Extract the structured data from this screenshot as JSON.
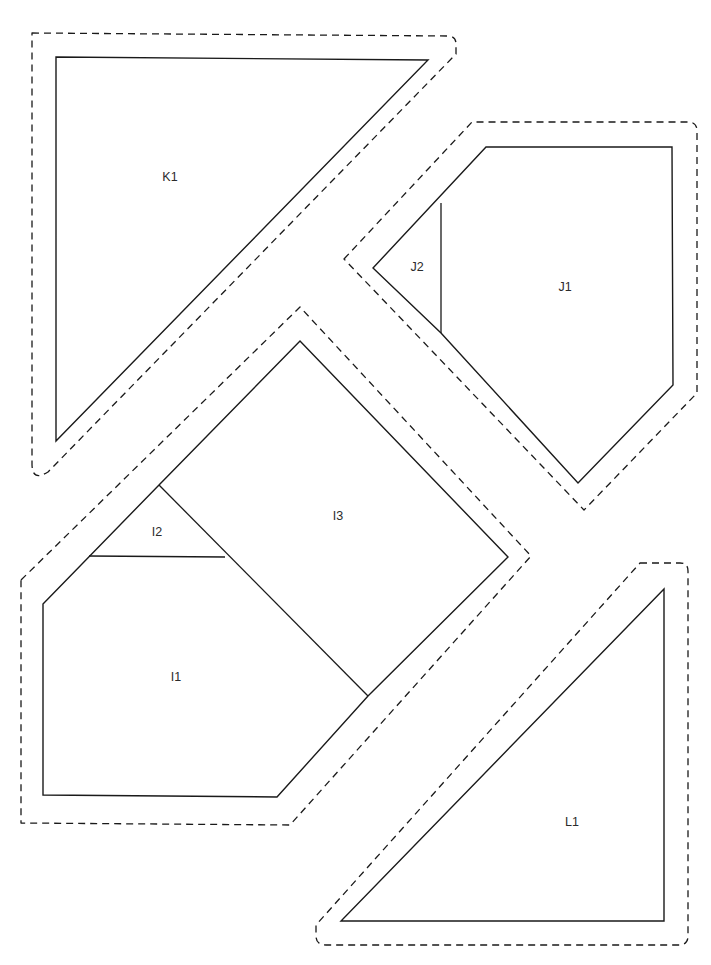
{
  "document": {
    "title": "Pattern Pieces Layout",
    "background_color": "#ffffff",
    "line_color": "#1a1a1a",
    "label_color": "#2b2b2b",
    "width": 711,
    "height": 965
  },
  "pieces": [
    {
      "id": "K",
      "label": "K1",
      "label_x": 170,
      "label_y": 178,
      "cut_path": "M 56 57 L 428 60 L 56 441 Z",
      "dashed_path": "M 32 33 L 448 36 Q 456 36 456 44 L 456 54 L 48 472 Q 32 482 32 464 Z",
      "internal_lines": []
    },
    {
      "id": "J",
      "label": "J1",
      "label_x": 565,
      "label_y": 288,
      "cut_path": "M 373 268 L 486 147 L 672 147 L 673 385 L 578 483 L 441 333 Z",
      "dashed_path": "M 344 259 L 472 122 L 688 122 Q 697 122 697 131 L 697 393 L 584 510 L 412 330 Z",
      "internal_lines": [
        {
          "name": "j-divider",
          "path": "M 441 203 L 441 333"
        }
      ],
      "sub_labels": [
        {
          "text": "J2",
          "x": 417,
          "y": 268
        }
      ]
    },
    {
      "id": "I",
      "label": "I1",
      "label_x": 176,
      "label_y": 678,
      "cut_path": "M 43 604 L 159 485 L 300 341 L 508 557 L 368 696 L 277 797 L 43 795 Z",
      "dashed_path": "M 21 580 L 300 307 L 531 556 L 290 825 L 21 823 Z",
      "internal_lines": [
        {
          "name": "i2-i1-divider",
          "path": "M 89 556 L 225 557"
        },
        {
          "name": "i3-i1-divider",
          "path": "M 159 485 L 368 696"
        }
      ],
      "sub_labels": [
        {
          "text": "I2",
          "x": 157,
          "y": 533
        },
        {
          "text": "I3",
          "x": 338,
          "y": 517
        }
      ]
    },
    {
      "id": "L",
      "label": "L1",
      "label_x": 572,
      "label_y": 823,
      "cut_path": "M 664 589 L 664 921 L 341 921 Z",
      "dashed_path": "M 640 563 L 680 563 Q 688 563 688 571 L 688 936 Q 688 945 679 945 L 326 945 Q 316 945 316 936 L 316 925 Z",
      "internal_lines": []
    }
  ]
}
